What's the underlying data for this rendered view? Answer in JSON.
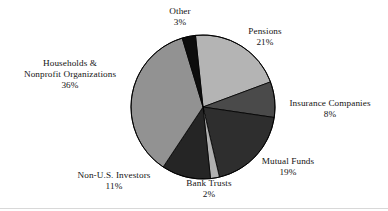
{
  "chart_data": {
    "type": "pie",
    "title": "",
    "subtitle": "",
    "xlabel": "",
    "ylabel": "",
    "legend_position": "none",
    "grid": false,
    "labels_outside": true,
    "units": "percent",
    "total": 100,
    "start_angle_deg": -96,
    "direction": "clockwise",
    "center": {
      "x": 203,
      "y": 107
    },
    "radius": 72,
    "categories": [
      "Pensions",
      "Insurance Companies",
      "Mutual Funds",
      "Bank Trusts",
      "Non-U.S. Investors",
      "Households & Nonprofit Organizations",
      "Other"
    ],
    "values": [
      21,
      8,
      19,
      2,
      11,
      36,
      3
    ],
    "slices": [
      {
        "name": "Pensions",
        "label_line1": "Pensions",
        "label_line2": "",
        "value": 21,
        "value_text": "21%",
        "color": "#b4b4b4"
      },
      {
        "name": "Insurance Companies",
        "label_line1": "Insurance Companies",
        "label_line2": "",
        "value": 8,
        "value_text": "8%",
        "color": "#4a4a4a"
      },
      {
        "name": "Mutual Funds",
        "label_line1": "Mutual Funds",
        "label_line2": "",
        "value": 19,
        "value_text": "19%",
        "color": "#2e2e2e"
      },
      {
        "name": "Bank Trusts",
        "label_line1": "Bank Trusts",
        "label_line2": "",
        "value": 2,
        "value_text": "2%",
        "color": "#b0b0b0"
      },
      {
        "name": "Non-U.S. Investors",
        "label_line1": "Non-U.S. Investors",
        "label_line2": "",
        "value": 11,
        "value_text": "11%",
        "color": "#252525"
      },
      {
        "name": "Households & Nonprofit Organizations",
        "label_line1": "Households &",
        "label_line2": "Nonprofit Organizations",
        "value": 36,
        "value_text": "36%",
        "color": "#929292"
      },
      {
        "name": "Other",
        "label_line1": "Other",
        "label_line2": "",
        "value": 3,
        "value_text": "3%",
        "color": "#0d0d0d"
      }
    ],
    "outline_color": "#000000",
    "background": "#ffffff"
  }
}
